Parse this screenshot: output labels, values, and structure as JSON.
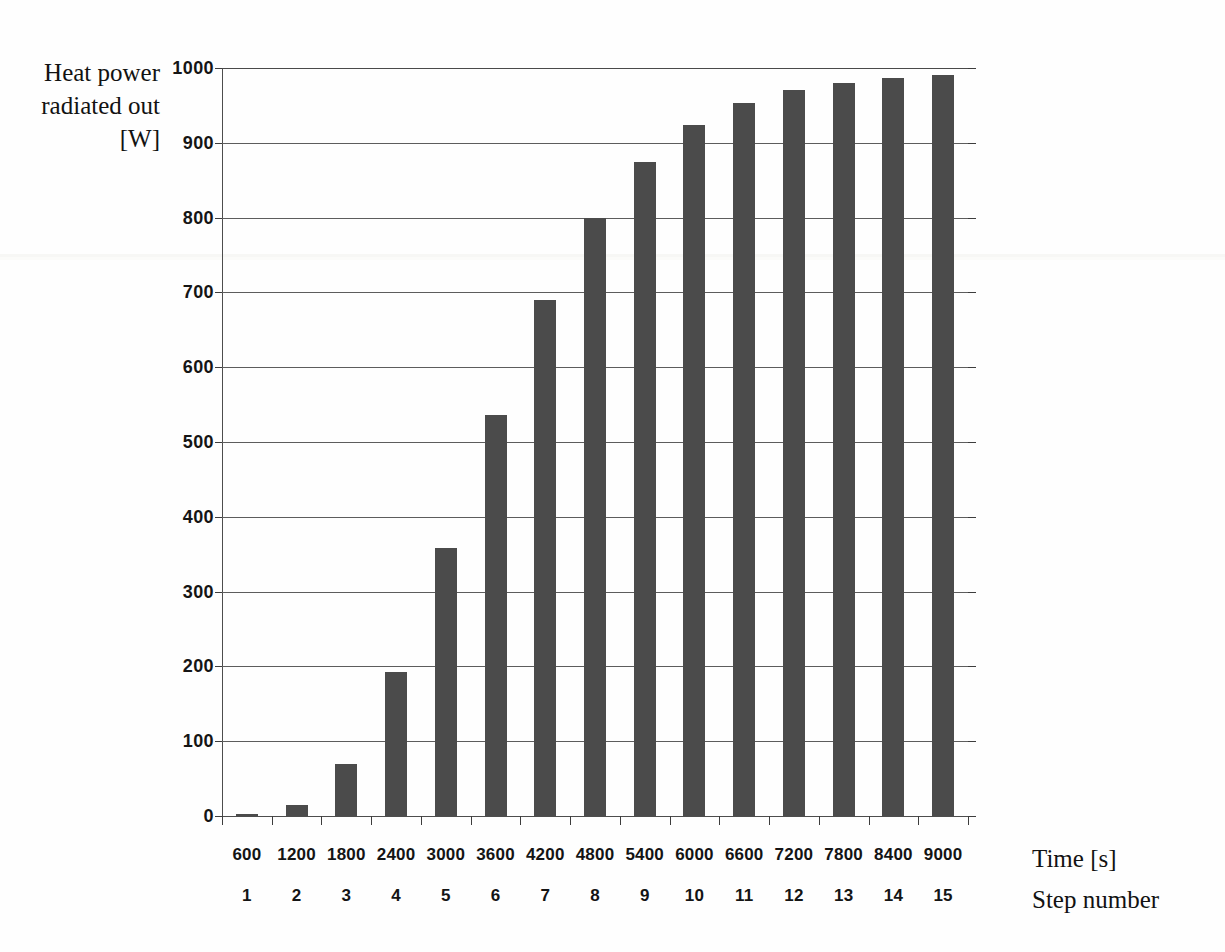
{
  "chart_data": {
    "type": "bar",
    "title": "",
    "ylabel": "Heat power radiated out [W]",
    "xlabel": "Time [s]",
    "xlabel2": "Step number",
    "categories": [
      "600",
      "1200",
      "1800",
      "2400",
      "3000",
      "3600",
      "4200",
      "4800",
      "5400",
      "6000",
      "6600",
      "7200",
      "7800",
      "8400",
      "9000"
    ],
    "categories2": [
      "1",
      "2",
      "3",
      "4",
      "5",
      "6",
      "7",
      "8",
      "9",
      "10",
      "11",
      "12",
      "13",
      "14",
      "15"
    ],
    "values": [
      3,
      15,
      70,
      192,
      358,
      536,
      690,
      799,
      875,
      924,
      953,
      970,
      980,
      986,
      991
    ],
    "ylim": [
      0,
      1000
    ],
    "yticks": [
      "0",
      "100",
      "200",
      "300",
      "400",
      "500",
      "600",
      "700",
      "800",
      "900",
      "1000"
    ],
    "ytick_values": [
      0,
      100,
      200,
      300,
      400,
      500,
      600,
      700,
      800,
      900,
      1000
    ],
    "grid": true,
    "legend": false,
    "bar_color": "#4b4b4b",
    "axis_color": "#4d4d4d",
    "grid_color": "#5d5d5d",
    "background": "#fefefe"
  },
  "axes": {
    "y_title_lines": [
      "Heat power",
      "radiated out",
      "[W]"
    ],
    "x_title_time": "Time [s]",
    "x_title_step": "Step number"
  }
}
